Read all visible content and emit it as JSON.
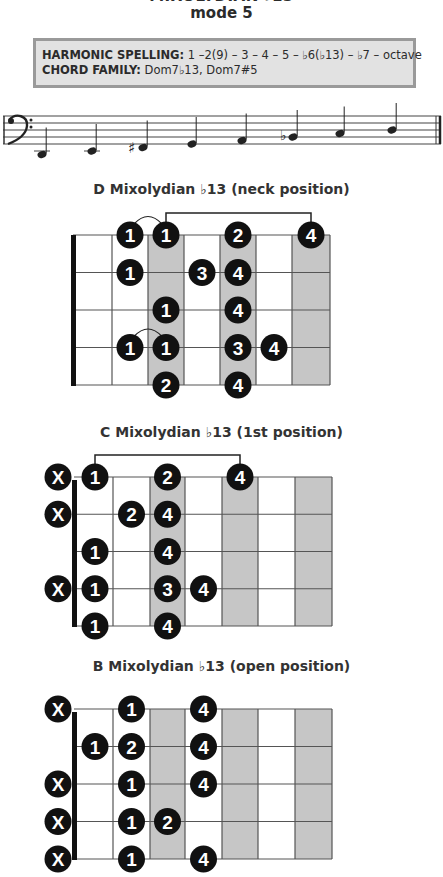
{
  "header": {
    "title": "MIXOLYDIAN ♭13",
    "subtitle": "mode 5"
  },
  "info_box": {
    "harmonic_spelling_label": "HARMONIC SPELLING:",
    "harmonic_spelling_value": " 1 –2(9) – 3 – 4 – 5 – ♭6(♭13) – ♭7 – octave",
    "chord_family_label": "CHORD FAMILY:",
    "chord_family_value": " Dom7♭13, Dom7#5"
  },
  "staff": {
    "clef": "bass",
    "notes": [
      {
        "pitch": "D2",
        "accidental": ""
      },
      {
        "pitch": "E2",
        "accidental": ""
      },
      {
        "pitch": "F#2",
        "accidental": "sharp"
      },
      {
        "pitch": "G2",
        "accidental": ""
      },
      {
        "pitch": "A2",
        "accidental": ""
      },
      {
        "pitch": "Bb2",
        "accidental": "flat"
      },
      {
        "pitch": "C3",
        "accidental": ""
      },
      {
        "pitch": "D3",
        "accidental": ""
      }
    ],
    "final_barline": "double"
  },
  "diagrams": [
    {
      "title": "D Mixolydian ♭13 (neck position)",
      "strings": 5,
      "frets": 7,
      "shaded_frets": [
        3,
        5,
        7
      ],
      "muted_strings": [],
      "dots": [
        {
          "string": 1,
          "fret": 2,
          "finger": "1"
        },
        {
          "string": 1,
          "fret": 3,
          "finger": "1"
        },
        {
          "string": 1,
          "fret": 5,
          "finger": "2"
        },
        {
          "string": 1,
          "fret": 7,
          "finger": "4"
        },
        {
          "string": 2,
          "fret": 2,
          "finger": "1"
        },
        {
          "string": 2,
          "fret": 4,
          "finger": "3"
        },
        {
          "string": 2,
          "fret": 5,
          "finger": "4"
        },
        {
          "string": 3,
          "fret": 3,
          "finger": "1"
        },
        {
          "string": 3,
          "fret": 5,
          "finger": "4"
        },
        {
          "string": 4,
          "fret": 2,
          "finger": "1"
        },
        {
          "string": 4,
          "fret": 3,
          "finger": "1"
        },
        {
          "string": 4,
          "fret": 5,
          "finger": "3"
        },
        {
          "string": 4,
          "fret": 6,
          "finger": "4"
        },
        {
          "string": 5,
          "fret": 3,
          "finger": "2"
        },
        {
          "string": 5,
          "fret": 5,
          "finger": "4"
        }
      ],
      "ties": [
        {
          "string": 1,
          "from_fret": 2,
          "to_fret": 3
        },
        {
          "string": 4,
          "from_fret": 2,
          "to_fret": 3
        }
      ],
      "bracket": {
        "string": 1,
        "from_fret": 3,
        "to_fret": 7
      }
    },
    {
      "title": "C Mixolydian ♭13 (1st position)",
      "strings": 5,
      "frets": 7,
      "shaded_frets": [
        3,
        5,
        7
      ],
      "muted_strings": [
        1,
        2,
        4
      ],
      "dots": [
        {
          "string": 1,
          "fret": 1,
          "finger": "1"
        },
        {
          "string": 1,
          "fret": 3,
          "finger": "2"
        },
        {
          "string": 1,
          "fret": 5,
          "finger": "4"
        },
        {
          "string": 2,
          "fret": 2,
          "finger": "2"
        },
        {
          "string": 2,
          "fret": 3,
          "finger": "4"
        },
        {
          "string": 3,
          "fret": 1,
          "finger": "1"
        },
        {
          "string": 3,
          "fret": 3,
          "finger": "4"
        },
        {
          "string": 4,
          "fret": 1,
          "finger": "1"
        },
        {
          "string": 4,
          "fret": 3,
          "finger": "3"
        },
        {
          "string": 4,
          "fret": 4,
          "finger": "4"
        },
        {
          "string": 5,
          "fret": 1,
          "finger": "1"
        },
        {
          "string": 5,
          "fret": 3,
          "finger": "4"
        }
      ],
      "ties": [],
      "bracket": {
        "string": 1,
        "from_fret": 1,
        "to_fret": 5
      }
    },
    {
      "title": "B Mixolydian ♭13 (open position)",
      "strings": 5,
      "frets": 7,
      "shaded_frets": [
        3,
        5,
        7
      ],
      "muted_strings": [
        1,
        3,
        4,
        5
      ],
      "dots": [
        {
          "string": 1,
          "fret": 2,
          "finger": "1"
        },
        {
          "string": 1,
          "fret": 4,
          "finger": "4"
        },
        {
          "string": 2,
          "fret": 1,
          "finger": "1"
        },
        {
          "string": 2,
          "fret": 2,
          "finger": "2"
        },
        {
          "string": 2,
          "fret": 4,
          "finger": "4"
        },
        {
          "string": 3,
          "fret": 2,
          "finger": "1"
        },
        {
          "string": 3,
          "fret": 4,
          "finger": "4"
        },
        {
          "string": 4,
          "fret": 2,
          "finger": "1"
        },
        {
          "string": 4,
          "fret": 3,
          "finger": "2"
        },
        {
          "string": 5,
          "fret": 2,
          "finger": "1"
        },
        {
          "string": 5,
          "fret": 4,
          "finger": "4"
        }
      ],
      "ties": [],
      "bracket": null
    }
  ],
  "muted_label": "X",
  "colors": {
    "dot": "#111111",
    "dot_text": "#ffffff",
    "shade": "#c6c6c6",
    "grid": "#555555",
    "box_fill": "#e2e2e2",
    "box_border": "#9a9a9a"
  }
}
